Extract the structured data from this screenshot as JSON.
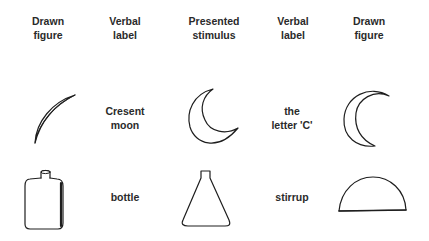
{
  "headers": [
    {
      "line1": "Drawn",
      "line2": "figure"
    },
    {
      "line1": "Verbal",
      "line2": "label"
    },
    {
      "line1": "Presented",
      "line2": "stimulus"
    },
    {
      "line1": "Verbal",
      "line2": "label"
    },
    {
      "line1": "Drawn",
      "line2": "figure"
    }
  ],
  "rows": [
    {
      "left_drawn_figure": "thin-crescent-icon",
      "left_label": {
        "line1": "Cresent",
        "line2": "moon"
      },
      "stimulus": "crescent-moon-icon",
      "right_label": {
        "line1": "the",
        "line2": "letter 'C'"
      },
      "right_drawn_figure": "c-shaped-crescent-icon"
    },
    {
      "left_drawn_figure": "bottle-icon",
      "left_label": {
        "line1": "bottle"
      },
      "stimulus": "flask-icon",
      "right_label": {
        "line1": "stirrup"
      },
      "right_drawn_figure": "semicircle-icon"
    }
  ]
}
